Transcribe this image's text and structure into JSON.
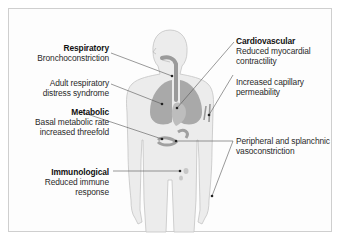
{
  "figure": {
    "type": "anatomical diagram",
    "labels": [
      {
        "id": "respiratory",
        "heading": "Respiratory",
        "lines": [
          "Bronchoconstriction"
        ],
        "side": "left"
      },
      {
        "id": "ards",
        "heading": "",
        "lines": [
          "Adult respiratory",
          "distress syndrome"
        ],
        "side": "left"
      },
      {
        "id": "metabolic",
        "heading": "Metabolic",
        "lines": [
          "Basal metabolic rate",
          "increased threefold"
        ],
        "side": "left"
      },
      {
        "id": "immunological",
        "heading": "Immunological",
        "lines": [
          "Reduced immune",
          "response"
        ],
        "side": "left"
      },
      {
        "id": "cardiovascular",
        "heading": "Cardiovascular",
        "lines": [
          "Reduced myocardial",
          "contractility"
        ],
        "side": "right"
      },
      {
        "id": "capillary",
        "heading": "",
        "lines": [
          "Increased capillary",
          "permeability"
        ],
        "side": "right"
      },
      {
        "id": "peripheral",
        "heading": "",
        "lines": [
          "Peripheral and splanchnic",
          "vasoconstriction"
        ],
        "side": "right"
      }
    ],
    "colors": {
      "body_fill": "#ececec",
      "body_outline": "#c4c4c4",
      "organ_fill": "#a9a9a9",
      "leader_line": "#555555",
      "frame_border": "#cfcfcf"
    }
  }
}
